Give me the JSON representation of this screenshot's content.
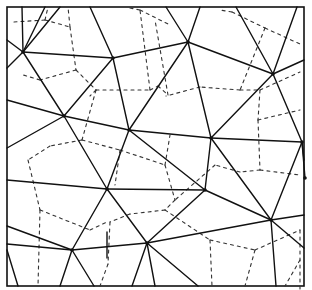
{
  "diagram": {
    "type": "delaunay-voronoi",
    "frame": {
      "x": 7,
      "y": 7,
      "w": 297,
      "h": 279
    },
    "colors": {
      "solid": "#111111",
      "dashed": "#333333",
      "background": "#ffffff"
    },
    "nodes": [
      [
        23,
        52
      ],
      [
        113,
        58
      ],
      [
        188,
        42
      ],
      [
        273,
        74
      ],
      [
        64,
        116
      ],
      [
        129,
        130
      ],
      [
        211,
        138
      ],
      [
        302,
        142
      ],
      [
        107,
        189
      ],
      [
        205,
        190
      ],
      [
        271,
        220
      ],
      [
        72,
        250
      ],
      [
        147,
        243
      ],
      [
        305,
        178
      ]
    ],
    "solid_edges": [
      [
        [
          22,
          7
        ],
        [
          23,
          52
        ]
      ],
      [
        [
          45,
          7
        ],
        [
          23,
          52
        ]
      ],
      [
        [
          7,
          40
        ],
        [
          23,
          52
        ]
      ],
      [
        [
          7,
          68
        ],
        [
          23,
          52
        ]
      ],
      [
        [
          23,
          52
        ],
        [
          64,
          116
        ]
      ],
      [
        [
          23,
          52
        ],
        [
          113,
          58
        ]
      ],
      [
        [
          60,
          7
        ],
        [
          23,
          52
        ]
      ],
      [
        [
          113,
          58
        ],
        [
          90,
          7
        ]
      ],
      [
        [
          113,
          58
        ],
        [
          188,
          42
        ]
      ],
      [
        [
          113,
          58
        ],
        [
          64,
          116
        ]
      ],
      [
        [
          113,
          58
        ],
        [
          129,
          130
        ]
      ],
      [
        [
          188,
          42
        ],
        [
          166,
          7
        ]
      ],
      [
        [
          188,
          42
        ],
        [
          200,
          7
        ]
      ],
      [
        [
          188,
          42
        ],
        [
          273,
          74
        ]
      ],
      [
        [
          188,
          42
        ],
        [
          129,
          130
        ]
      ],
      [
        [
          188,
          42
        ],
        [
          211,
          138
        ]
      ],
      [
        [
          273,
          74
        ],
        [
          236,
          7
        ]
      ],
      [
        [
          273,
          74
        ],
        [
          297,
          7
        ]
      ],
      [
        [
          273,
          74
        ],
        [
          304,
          60
        ]
      ],
      [
        [
          273,
          74
        ],
        [
          211,
          138
        ]
      ],
      [
        [
          273,
          74
        ],
        [
          302,
          142
        ]
      ],
      [
        [
          64,
          116
        ],
        [
          7,
          100
        ]
      ],
      [
        [
          64,
          116
        ],
        [
          7,
          148
        ]
      ],
      [
        [
          64,
          116
        ],
        [
          129,
          130
        ]
      ],
      [
        [
          64,
          116
        ],
        [
          107,
          189
        ]
      ],
      [
        [
          129,
          130
        ],
        [
          211,
          138
        ]
      ],
      [
        [
          129,
          130
        ],
        [
          107,
          189
        ]
      ],
      [
        [
          129,
          130
        ],
        [
          205,
          190
        ]
      ],
      [
        [
          211,
          138
        ],
        [
          302,
          142
        ]
      ],
      [
        [
          211,
          138
        ],
        [
          205,
          190
        ]
      ],
      [
        [
          211,
          138
        ],
        [
          271,
          220
        ]
      ],
      [
        [
          302,
          142
        ],
        [
          271,
          220
        ]
      ],
      [
        [
          302,
          142
        ],
        [
          304,
          160
        ]
      ],
      [
        [
          302,
          142
        ],
        [
          305,
          178
        ]
      ],
      [
        [
          107,
          189
        ],
        [
          7,
          180
        ]
      ],
      [
        [
          107,
          189
        ],
        [
          72,
          250
        ]
      ],
      [
        [
          107,
          189
        ],
        [
          147,
          243
        ]
      ],
      [
        [
          107,
          189
        ],
        [
          205,
          190
        ]
      ],
      [
        [
          205,
          190
        ],
        [
          147,
          243
        ]
      ],
      [
        [
          205,
          190
        ],
        [
          271,
          220
        ]
      ],
      [
        [
          271,
          220
        ],
        [
          304,
          215
        ]
      ],
      [
        [
          271,
          220
        ],
        [
          304,
          248
        ]
      ],
      [
        [
          271,
          220
        ],
        [
          276,
          286
        ]
      ],
      [
        [
          271,
          220
        ],
        [
          147,
          243
        ]
      ],
      [
        [
          72,
          250
        ],
        [
          7,
          226
        ]
      ],
      [
        [
          72,
          250
        ],
        [
          7,
          244
        ]
      ],
      [
        [
          72,
          250
        ],
        [
          60,
          286
        ]
      ],
      [
        [
          72,
          250
        ],
        [
          94,
          286
        ]
      ],
      [
        [
          72,
          250
        ],
        [
          147,
          243
        ]
      ],
      [
        [
          7,
          250
        ],
        [
          18,
          286
        ]
      ],
      [
        [
          147,
          243
        ],
        [
          132,
          286
        ]
      ],
      [
        [
          147,
          243
        ],
        [
          155,
          286
        ]
      ],
      [
        [
          147,
          243
        ],
        [
          198,
          286
        ]
      ]
    ],
    "dashed_edges": [
      [
        [
          14,
          22
        ],
        [
          45,
          20
        ]
      ],
      [
        [
          45,
          20
        ],
        [
          48,
          7
        ]
      ],
      [
        [
          45,
          20
        ],
        [
          70,
          27
        ]
      ],
      [
        [
          70,
          27
        ],
        [
          68,
          7
        ]
      ],
      [
        [
          70,
          27
        ],
        [
          76,
          70
        ]
      ],
      [
        [
          76,
          70
        ],
        [
          40,
          80
        ]
      ],
      [
        [
          40,
          80
        ],
        [
          20,
          74
        ]
      ],
      [
        [
          76,
          70
        ],
        [
          96,
          90
        ]
      ],
      [
        [
          96,
          90
        ],
        [
          90,
          96
        ]
      ],
      [
        [
          96,
          90
        ],
        [
          150,
          90
        ]
      ],
      [
        [
          150,
          90
        ],
        [
          140,
          10
        ]
      ],
      [
        [
          150,
          90
        ],
        [
          158,
          86
        ]
      ],
      [
        [
          158,
          86
        ],
        [
          168,
          95
        ]
      ],
      [
        [
          168,
          95
        ],
        [
          155,
          20
        ]
      ],
      [
        [
          130,
          8
        ],
        [
          140,
          10
        ]
      ],
      [
        [
          140,
          10
        ],
        [
          170,
          25
        ]
      ],
      [
        [
          232,
          12
        ],
        [
          220,
          10
        ]
      ],
      [
        [
          232,
          12
        ],
        [
          265,
          28
        ]
      ],
      [
        [
          265,
          28
        ],
        [
          300,
          44
        ]
      ],
      [
        [
          265,
          28
        ],
        [
          240,
          90
        ]
      ],
      [
        [
          240,
          90
        ],
        [
          260,
          90
        ]
      ],
      [
        [
          260,
          90
        ],
        [
          300,
          72
        ]
      ],
      [
        [
          260,
          90
        ],
        [
          258,
          120
        ]
      ],
      [
        [
          240,
          90
        ],
        [
          200,
          87
        ]
      ],
      [
        [
          200,
          87
        ],
        [
          166,
          96
        ]
      ],
      [
        [
          96,
          90
        ],
        [
          82,
          140
        ]
      ],
      [
        [
          82,
          140
        ],
        [
          50,
          146
        ]
      ],
      [
        [
          82,
          140
        ],
        [
          120,
          150
        ]
      ],
      [
        [
          120,
          150
        ],
        [
          115,
          185
        ]
      ],
      [
        [
          120,
          150
        ],
        [
          165,
          165
        ]
      ],
      [
        [
          165,
          165
        ],
        [
          170,
          135
        ]
      ],
      [
        [
          165,
          165
        ],
        [
          175,
          200
        ]
      ],
      [
        [
          258,
          120
        ],
        [
          300,
          110
        ]
      ],
      [
        [
          258,
          120
        ],
        [
          260,
          170
        ]
      ],
      [
        [
          260,
          170
        ],
        [
          240,
          172
        ]
      ],
      [
        [
          260,
          170
        ],
        [
          300,
          175
        ]
      ],
      [
        [
          240,
          172
        ],
        [
          215,
          165
        ]
      ],
      [
        [
          215,
          165
        ],
        [
          175,
          200
        ]
      ],
      [
        [
          175,
          200
        ],
        [
          165,
          210
        ]
      ],
      [
        [
          165,
          210
        ],
        [
          130,
          214
        ]
      ],
      [
        [
          130,
          214
        ],
        [
          110,
          222
        ]
      ],
      [
        [
          110,
          222
        ],
        [
          108,
          264
        ]
      ],
      [
        [
          108,
          264
        ],
        [
          100,
          286
        ]
      ],
      [
        [
          50,
          146
        ],
        [
          28,
          160
        ]
      ],
      [
        [
          28,
          160
        ],
        [
          40,
          210
        ]
      ],
      [
        [
          40,
          210
        ],
        [
          38,
          286
        ]
      ],
      [
        [
          40,
          210
        ],
        [
          90,
          230
        ]
      ],
      [
        [
          90,
          230
        ],
        [
          107,
          222
        ]
      ],
      [
        [
          165,
          210
        ],
        [
          210,
          240
        ]
      ],
      [
        [
          210,
          240
        ],
        [
          255,
          250
        ]
      ],
      [
        [
          210,
          240
        ],
        [
          212,
          286
        ]
      ],
      [
        [
          255,
          250
        ],
        [
          300,
          230
        ]
      ],
      [
        [
          255,
          250
        ],
        [
          245,
          286
        ]
      ],
      [
        [
          300,
          230
        ],
        [
          300,
          290
        ]
      ],
      [
        [
          300,
          260
        ],
        [
          285,
          286
        ]
      ]
    ],
    "solid_extra": [
      [
        [
          107,
          232
        ],
        [
          107,
          258
        ]
      ]
    ]
  }
}
